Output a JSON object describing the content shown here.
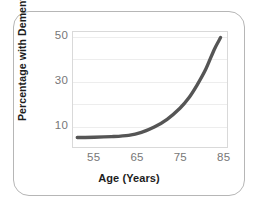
{
  "chart_data": {
    "type": "line",
    "title": "",
    "xlabel": "Age (Years)",
    "ylabel": "Percentage with Dementia",
    "xlim": [
      50,
      86
    ],
    "ylim": [
      0,
      52
    ],
    "xticks": [
      55,
      65,
      75,
      85
    ],
    "xtick_labels": [
      "55",
      "65",
      "75",
      "85"
    ],
    "yticks": [
      10,
      30,
      50
    ],
    "ytick_labels": [
      "10",
      "30",
      "50"
    ],
    "gridlines_y": [
      10,
      20,
      30,
      40,
      50
    ],
    "grid": true,
    "legend": false,
    "series": [
      {
        "name": "Percentage with Dementia",
        "color": "#555555",
        "x": [
          51,
          55,
          59,
          63,
          66,
          69,
          72,
          75,
          77,
          79,
          81,
          83,
          84.5
        ],
        "values": [
          4.3,
          4.4,
          4.7,
          5.3,
          6.6,
          9.0,
          12.5,
          17.5,
          22.0,
          28.0,
          35.0,
          44.0,
          49.5
        ]
      }
    ]
  },
  "axes": {
    "y_title": "Percentage with Dementia",
    "x_title": "Age (Years)"
  }
}
